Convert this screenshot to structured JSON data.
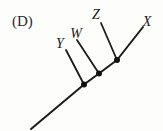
{
  "figure": {
    "label": "(D)",
    "type": "cladogram",
    "taxa_branching_order": [
      "Y",
      "W",
      "Z",
      "X"
    ],
    "node_count": 3,
    "colors": {
      "line": "#1b1b1b",
      "node": "#111111",
      "background": "#fdfdfc",
      "text": "#1a1a1a"
    }
  },
  "labels": {
    "figure": "(D)",
    "taxon_y": "Y",
    "taxon_w": "W",
    "taxon_z": "Z",
    "taxon_x": "X"
  }
}
